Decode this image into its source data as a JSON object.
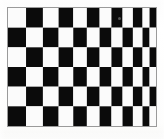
{
  "image": {
    "title": "Perspective checkerboard",
    "subject": "checkerboard-pattern",
    "width": 164,
    "height": 139,
    "background_color": "#ffffff"
  },
  "board": {
    "name": "checkerboard",
    "rows": 6,
    "columns": 12,
    "dark_color": "#0b0b0b",
    "light_color": "#fbfbfb",
    "frame_color": "#9a9a9a",
    "frame_width": 1,
    "top_left_cell_color": "light",
    "bottom_left_cell_color": "dark",
    "projection": "perspective",
    "vanishing_direction": "right",
    "bounds": {
      "x": 7,
      "y": 7,
      "width": 150,
      "height": 120
    },
    "column_x_fractions": [
      0.0,
      0.122,
      0.236,
      0.342,
      0.441,
      0.533,
      0.619,
      0.699,
      0.774,
      0.844,
      0.909,
      0.9565,
      1.0
    ],
    "row_y_fractions": [
      0.0,
      0.1667,
      0.3333,
      0.5,
      0.6667,
      0.8333,
      1.0
    ],
    "row_labels": [
      "row-1",
      "row-2",
      "row-3",
      "row-4",
      "row-5",
      "row-6"
    ],
    "pattern": [
      [
        "light",
        "dark",
        "light",
        "dark",
        "light",
        "dark",
        "light",
        "dark",
        "light",
        "dark",
        "light",
        "dark"
      ],
      [
        "dark",
        "light",
        "dark",
        "light",
        "dark",
        "light",
        "dark",
        "light",
        "dark",
        "light",
        "dark",
        "light"
      ],
      [
        "light",
        "dark",
        "light",
        "dark",
        "light",
        "dark",
        "light",
        "dark",
        "light",
        "dark",
        "light",
        "dark"
      ],
      [
        "dark",
        "light",
        "dark",
        "light",
        "dark",
        "light",
        "dark",
        "light",
        "dark",
        "light",
        "dark",
        "light"
      ],
      [
        "light",
        "dark",
        "light",
        "dark",
        "light",
        "dark",
        "light",
        "dark",
        "light",
        "dark",
        "light",
        "dark"
      ],
      [
        "dark",
        "light",
        "dark",
        "light",
        "dark",
        "light",
        "dark",
        "light",
        "dark",
        "light",
        "dark",
        "light"
      ]
    ]
  },
  "artifacts": {
    "speck": {
      "name": "scan-speck",
      "x": 118,
      "y": 17,
      "color": "#6e6e6e"
    }
  }
}
